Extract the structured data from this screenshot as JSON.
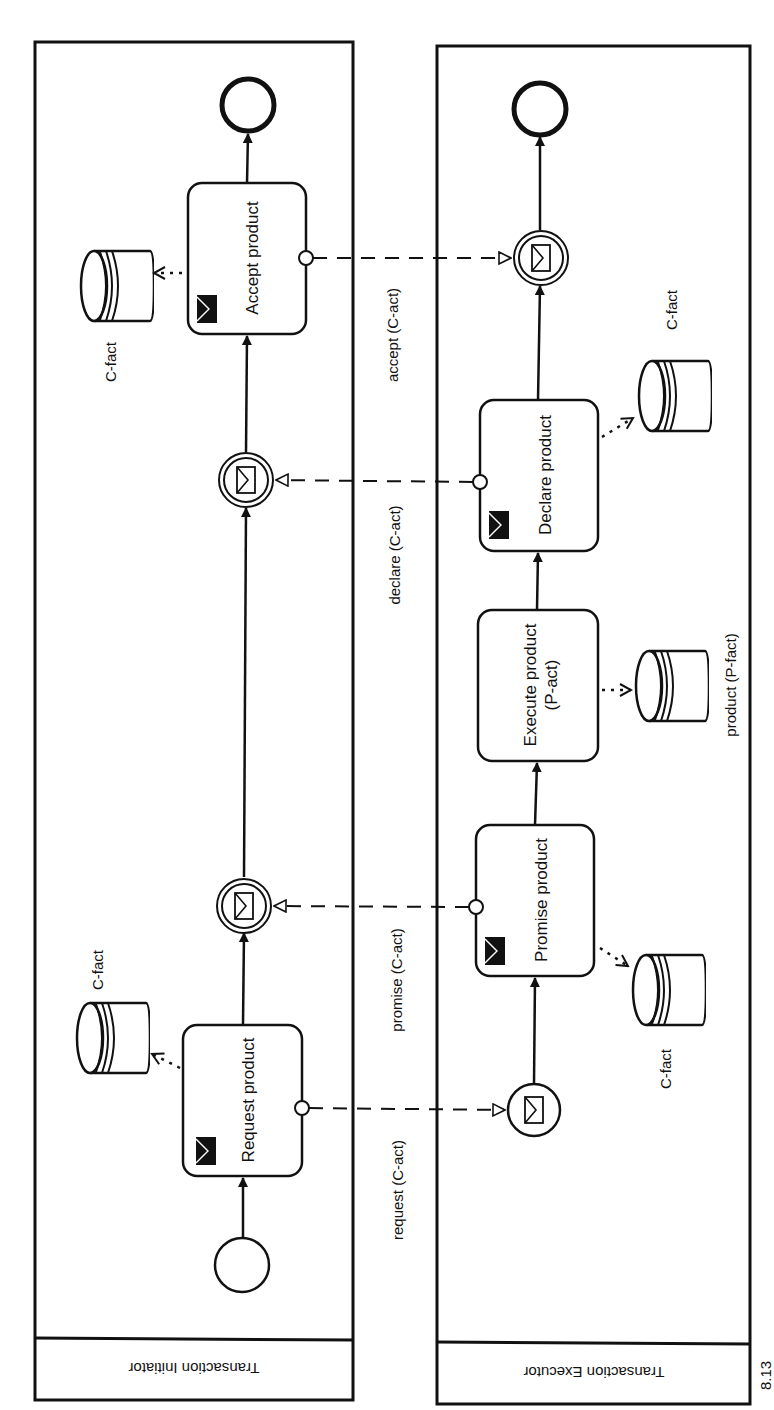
{
  "pools": {
    "initiator": {
      "label": "Transaction Initiator"
    },
    "executor": {
      "label": "Transaction Executor"
    }
  },
  "initiator_lane": {
    "request_task": "Request product",
    "accept_task": "Accept product",
    "datastore_request": "C-fact",
    "datastore_accept": "C-fact"
  },
  "executor_lane": {
    "promise_task": "Promise product",
    "execute_task_line1": "Execute product",
    "execute_task_line2": "(P-act)",
    "declare_task": "Declare product",
    "datastore_promise": "C-fact",
    "datastore_execute": "product (P-fact)",
    "datastore_declare": "C-fact"
  },
  "message_flows": {
    "request": "request (C-act)",
    "promise": "promise (C-act)",
    "declare": "declare (C-act)",
    "accept": "accept (C-act)"
  },
  "caption": "8.13"
}
